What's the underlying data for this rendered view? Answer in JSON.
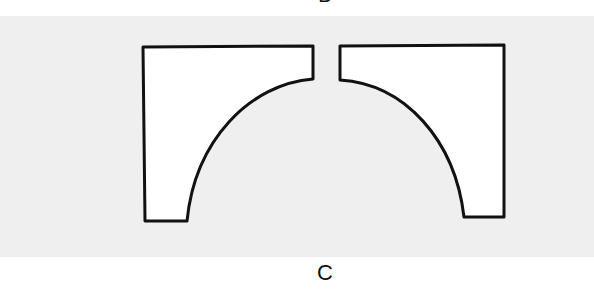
{
  "figure": {
    "top_label": "B",
    "bottom_label": "C",
    "panel_color": "#efefef",
    "stroke_color": "#111111",
    "fill_color": "#ffffff",
    "shapes": [
      {
        "name": "left-arch-half",
        "description": "Left half of an arch with concave quarter-circle cutout"
      },
      {
        "name": "right-arch-half",
        "description": "Right half of an arch with concave quarter-circle cutout"
      }
    ]
  }
}
